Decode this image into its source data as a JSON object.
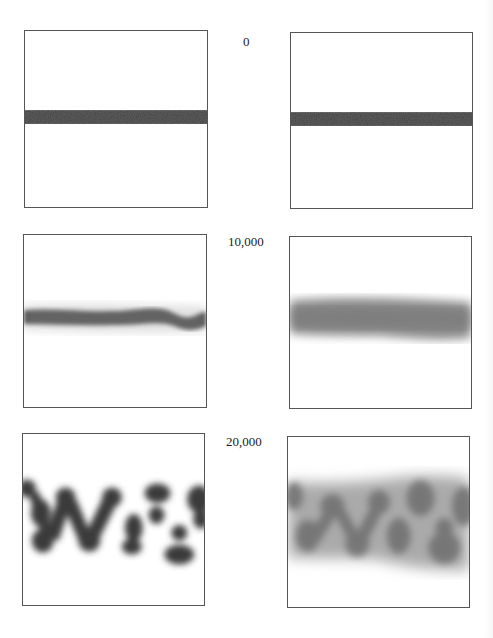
{
  "figure": {
    "rows": [
      {
        "label": "0",
        "left": {
          "state": "sharp-stripe"
        },
        "right": {
          "state": "sharp-stripe"
        }
      },
      {
        "label": "10,000",
        "left": {
          "state": "slightly-wavy-stripe"
        },
        "right": {
          "state": "diffuse-stripe"
        }
      },
      {
        "label": "20,000",
        "left": {
          "state": "fingered-blobs"
        },
        "right": {
          "state": "diffuse-fingered-blobs"
        }
      }
    ],
    "colors": {
      "stripe": "#5a5a5a",
      "dark_blob": "#3a3a3a",
      "diffuse": "#888888",
      "border": "#555555"
    }
  }
}
